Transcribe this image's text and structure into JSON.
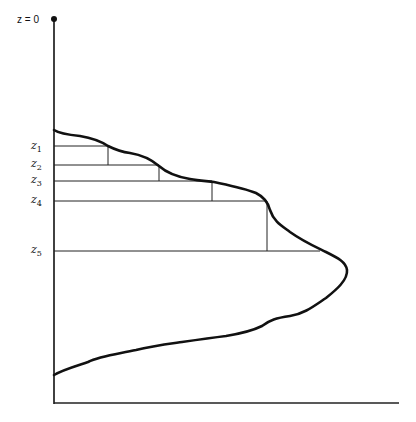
{
  "diagram": {
    "origin_label": "z = 0",
    "level_labels": [
      {
        "base": "z",
        "sub": "1",
        "y": 146,
        "line_end_x": 108
      },
      {
        "base": "z",
        "sub": "2",
        "y": 165,
        "line_end_x": 159
      },
      {
        "base": "z",
        "sub": "3",
        "y": 181,
        "line_end_x": 212
      },
      {
        "base": "z",
        "sub": "4",
        "y": 201,
        "line_end_x": 267
      },
      {
        "base": "z",
        "sub": "5",
        "y": 251,
        "line_end_x": 320
      }
    ],
    "vertical_drops": [
      {
        "x": 108,
        "y1": 146,
        "y2": 165
      },
      {
        "x": 159,
        "y1": 165,
        "y2": 181
      },
      {
        "x": 212,
        "y1": 181,
        "y2": 201
      },
      {
        "x": 267,
        "y1": 201,
        "y2": 251
      }
    ],
    "colors": {
      "ink": "#111111",
      "background": "#ffffff"
    }
  }
}
